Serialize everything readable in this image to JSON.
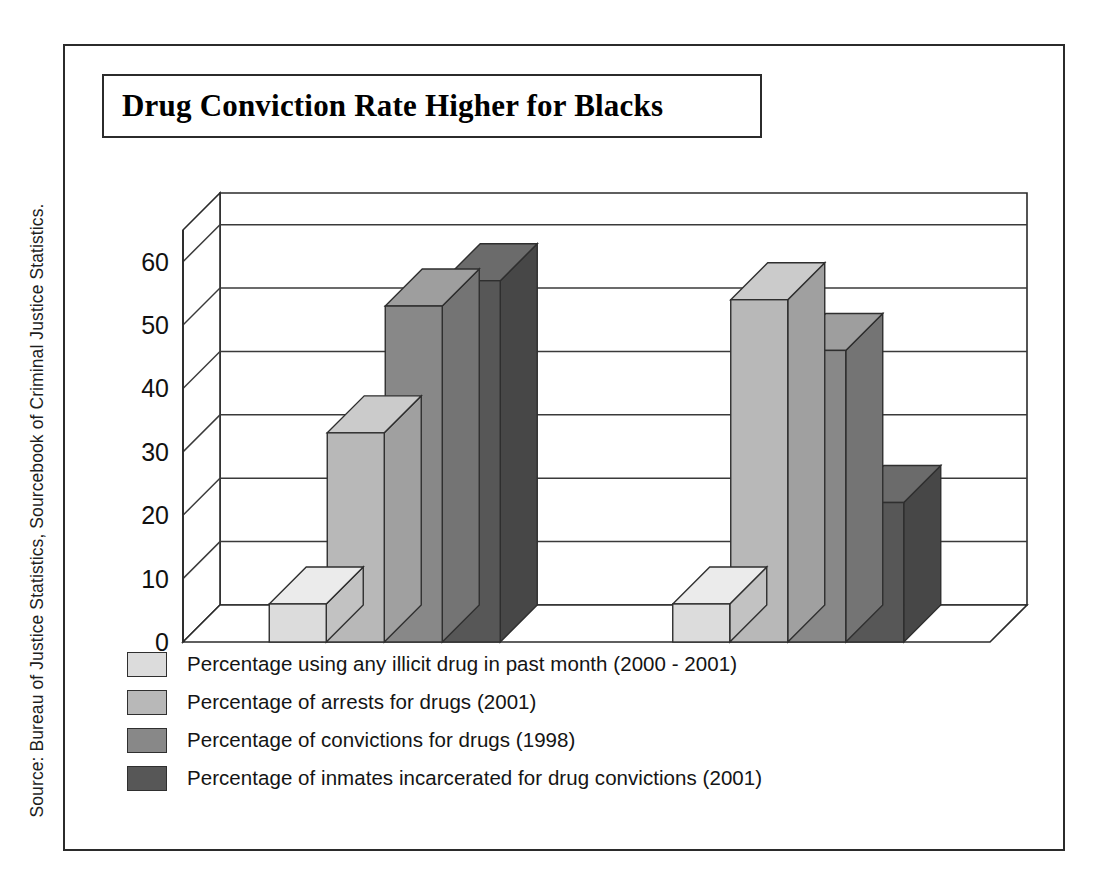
{
  "title": "Drug Conviction Rate Higher for Blacks",
  "source_credit": "Source: Bureau of Justice Statistics, Sourcebook of Criminal Justice Statistics.",
  "axis": {
    "y_ticks": [
      "0",
      "10",
      "20",
      "30",
      "40",
      "50",
      "60"
    ]
  },
  "categories": [
    "Black",
    "White"
  ],
  "legend": [
    {
      "label": "Percentage using any illicit drug in past month (2000 - 2001)",
      "color": "#dcdcdc"
    },
    {
      "label": "Percentage of arrests for drugs (2001)",
      "color": "#b8b8b8"
    },
    {
      "label": "Percentage of convictions for drugs (1998)",
      "color": "#888888"
    },
    {
      "label": "Percentage of inmates incarcerated for drug convictions (2001)",
      "color": "#575757"
    }
  ],
  "colors": {
    "series1_front": "#dcdcdc",
    "series1_top": "#ebebeb",
    "series1_side": "#c2c2c2",
    "series2_front": "#b8b8b8",
    "series2_top": "#cbcbcb",
    "series2_side": "#a0a0a0",
    "series3_front": "#888888",
    "series3_top": "#9e9e9e",
    "series3_side": "#747474",
    "series4_front": "#575757",
    "series4_top": "#6b6b6b",
    "series4_side": "#474747",
    "frame": "#2b2b2b",
    "gridline": "#3a3a3a",
    "text": "#111111"
  },
  "chart_data": {
    "type": "bar",
    "title": "Drug Conviction Rate Higher for Blacks",
    "xlabel": "",
    "ylabel": "",
    "ylim": [
      0,
      65
    ],
    "yticks": [
      0,
      10,
      20,
      30,
      40,
      50,
      60
    ],
    "grid": true,
    "legend_position": "bottom",
    "style": "3d-grouped-bars",
    "categories": [
      "Black",
      "White"
    ],
    "series": [
      {
        "name": "Percentage using any illicit drug in past month (2000 - 2001)",
        "values": [
          6,
          6
        ],
        "color": "#dcdcdc"
      },
      {
        "name": "Percentage of arrests for drugs (2001)",
        "values": [
          33,
          54
        ],
        "color": "#b8b8b8"
      },
      {
        "name": "Percentage of convictions for drugs (1998)",
        "values": [
          53,
          46
        ],
        "color": "#888888"
      },
      {
        "name": "Percentage of inmates incarcerated for drug convictions (2001)",
        "values": [
          57,
          22
        ],
        "color": "#575757"
      }
    ],
    "annotations": [
      "Source: Bureau of Justice Statistics, Sourcebook of Criminal Justice Statistics."
    ]
  }
}
